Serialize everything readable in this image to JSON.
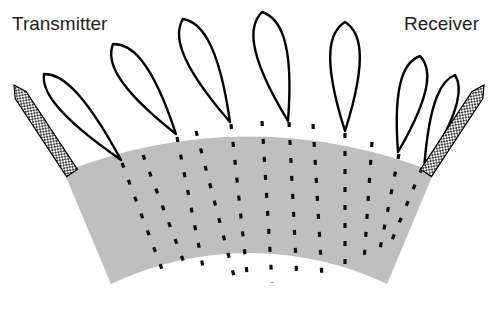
{
  "figure": {
    "type": "ultrasonic-beam-propagation-diagram",
    "width": 498,
    "height": 311,
    "background_color": "#ffffff"
  },
  "labels": {
    "transmitter": "Transmitter",
    "receiver": "Receiver",
    "transmitter_position": {
      "x": 12,
      "y": 30
    },
    "receiver_position": {
      "x": 404,
      "y": 30
    },
    "font_size": 19,
    "text_color": "#231f20"
  },
  "colors": {
    "medium_fill": "#bfbfbf",
    "curve_stroke": "#000000",
    "dash_stroke": "#0d0d0d",
    "probe_outline": "#000000",
    "probe_hatch": "#2b2b2b",
    "background": "#ffffff"
  },
  "medium": {
    "name": "specimen-arc",
    "description": "grey annular sector representing the test specimen",
    "fill": "#bfbfbf",
    "center": {
      "x": 249,
      "y": -205
    },
    "inner_radius": 322,
    "outer_radius": 500,
    "start_angle_deg": 56,
    "end_angle_deg": 124,
    "path": "M 64,172 A 500 500 0 0 1 434,172 L 387,284 A 322 322 0 0 0 111,284 Z"
  },
  "probes": [
    {
      "name": "transmitter-probe",
      "x1": 14,
      "y1": 85,
      "x2": 72,
      "y2": 173,
      "width": 13,
      "tip": "top",
      "hatched": true
    },
    {
      "name": "receiver-probe",
      "x1": 484,
      "y1": 85,
      "x2": 426,
      "y2": 173,
      "width": 13,
      "tip": "top",
      "hatched": true
    }
  ],
  "beam_lobes": {
    "count": 5,
    "description": "teardrop-shaped radiation lobes emanating upward from points on the specimen surface",
    "stroke_width": 2.4,
    "petals": [
      {
        "index": 0,
        "name": "lobe-1",
        "base_x": 121,
        "base_y": 160,
        "apex_x": 44,
        "apex_y": 74,
        "half_width": 20,
        "peak_height": 86
      },
      {
        "index": 1,
        "name": "lobe-2",
        "base_x": 176,
        "base_y": 134,
        "apex_x": 113,
        "apex_y": 44,
        "half_width": 24,
        "peak_height": 90
      },
      {
        "index": 2,
        "name": "lobe-3",
        "base_x": 230,
        "base_y": 122,
        "apex_x": 183,
        "apex_y": 19,
        "half_width": 24,
        "peak_height": 103
      },
      {
        "index": 3,
        "name": "lobe-4",
        "base_x": 288,
        "base_y": 121,
        "apex_x": 262,
        "apex_y": 12,
        "half_width": 26,
        "peak_height": 109
      },
      {
        "index": 4,
        "name": "lobe-5",
        "base_x": 345,
        "base_y": 131,
        "apex_x": 345,
        "apex_y": 22,
        "half_width": 25,
        "peak_height": 109
      },
      {
        "index": 5,
        "name": "lobe-6",
        "base_x": 398,
        "base_y": 152,
        "apex_x": 420,
        "apex_y": 56,
        "half_width": 22,
        "peak_height": 96
      },
      {
        "index": 6,
        "name": "lobe-7",
        "base_x": 424,
        "base_y": 170,
        "apex_x": 455,
        "apex_y": 75,
        "half_width": 18,
        "peak_height": 95
      }
    ]
  },
  "ray_paths": {
    "description": "dashed radial ray paths travelling through the specimen from the transmitter side toward the receiver side",
    "dash_pattern": "5 13",
    "stroke_width": 3.2,
    "count": 11,
    "rays": [
      {
        "name": "ray-1",
        "x1": 122,
        "y1": 163,
        "x2": 163,
        "y2": 272
      },
      {
        "name": "ray-2",
        "x1": 143,
        "y1": 155,
        "x2": 186,
        "y2": 268
      },
      {
        "name": "ray-3",
        "x1": 177,
        "y1": 137,
        "x2": 205,
        "y2": 277
      },
      {
        "name": "ray-4",
        "x1": 196,
        "y1": 131,
        "x2": 235,
        "y2": 280
      },
      {
        "name": "ray-5",
        "x1": 231,
        "y1": 124,
        "x2": 248,
        "y2": 283
      },
      {
        "name": "ray-6",
        "x1": 262,
        "y1": 121,
        "x2": 272,
        "y2": 283
      },
      {
        "name": "ray-7",
        "x1": 289,
        "y1": 122,
        "x2": 297,
        "y2": 282
      },
      {
        "name": "ray-8",
        "x1": 313,
        "y1": 124,
        "x2": 322,
        "y2": 278
      },
      {
        "name": "ray-9",
        "x1": 345,
        "y1": 133,
        "x2": 345,
        "y2": 272
      },
      {
        "name": "ray-10",
        "x1": 372,
        "y1": 142,
        "x2": 364,
        "y2": 262
      },
      {
        "name": "ray-11",
        "x1": 399,
        "y1": 154,
        "x2": 380,
        "y2": 249
      },
      {
        "name": "ray-12",
        "x1": 422,
        "y1": 168,
        "x2": 392,
        "y2": 240
      }
    ]
  }
}
